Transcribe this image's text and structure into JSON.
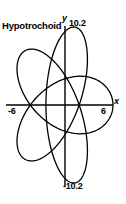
{
  "chart_data": {
    "type": "line",
    "title": "Hypotrochoid",
    "xlabel": "x",
    "ylabel": "y",
    "xlim": [
      -6,
      6
    ],
    "ylim": [
      -10.2,
      10.2
    ],
    "grid": false,
    "legend": null,
    "x_tick_labels": [
      "-6",
      "6"
    ],
    "y_tick_labels": [
      "-10.2",
      "10.2"
    ],
    "axis_color": "#000000",
    "curve_color": "#000000",
    "series": [
      {
        "name": "Hypotrochoid",
        "closed": true,
        "description": "Four-lobed hypotrochoid with 180 degree rotational symmetry; two large tilted loops (upper-right and lower-left) and two smaller tilted loops (upper-left and lower-right), all passing through the origin.",
        "parametric": {
          "R": 6,
          "r": 2.4,
          "d": 6.6,
          "x_expr": "(R - r) * cos(t) + d * cos((R - r) / r * t)",
          "y_expr": "(R - r) * sin(t) - d * sin((R - r) / r * t)",
          "t_range": [
            0,
            12.566370614359172
          ],
          "samples": 720
        },
        "extent": {
          "x_min": -6,
          "x_max": 6,
          "y_min": -10.2,
          "y_max": 10.2
        }
      }
    ]
  },
  "labels": {
    "title": "Hypotrochoid",
    "y_axis_name": "y",
    "y_max": "10.2",
    "y_min": "-10.2",
    "x_axis_name": "x",
    "x_min": "-6",
    "x_max": "6"
  },
  "colors": {
    "background": "#ffffff",
    "ink": "#000000"
  }
}
